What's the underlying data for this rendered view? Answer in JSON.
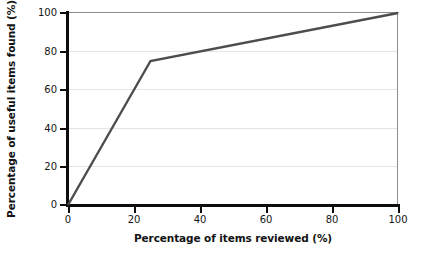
{
  "chart_data": {
    "type": "line",
    "title": "",
    "xlabel": "Percentage of items reviewed (%)",
    "ylabel": "Percentage of useful items found (%)",
    "xlim": [
      0,
      100
    ],
    "ylim": [
      0,
      100
    ],
    "xticks": [
      0,
      20,
      40,
      60,
      80,
      100
    ],
    "yticks": [
      0,
      20,
      40,
      60,
      80,
      100
    ],
    "xtick_labels": [
      "0",
      "20",
      "40",
      "60",
      "80",
      "100"
    ],
    "ytick_labels": [
      "0",
      "20",
      "40",
      "60",
      "80",
      "100"
    ],
    "grid": "horizontal",
    "legend": "none",
    "series": [
      {
        "name": "Useful items found",
        "color": "#4d4d4d",
        "x": [
          0,
          25,
          100
        ],
        "values": [
          0,
          75,
          100
        ],
        "points": [
          {
            "x": 0,
            "y": 0
          },
          {
            "x": 25,
            "y": 75
          },
          {
            "x": 100,
            "y": 100
          }
        ]
      }
    ],
    "annotations": []
  },
  "style": {
    "background": "#ffffff",
    "axis_color": "#0d0d0d",
    "grid_color": "#e4e4e4",
    "frame_color": "#8c8c8c",
    "line_color": "#4d4d4d",
    "text_color": "#151515"
  }
}
